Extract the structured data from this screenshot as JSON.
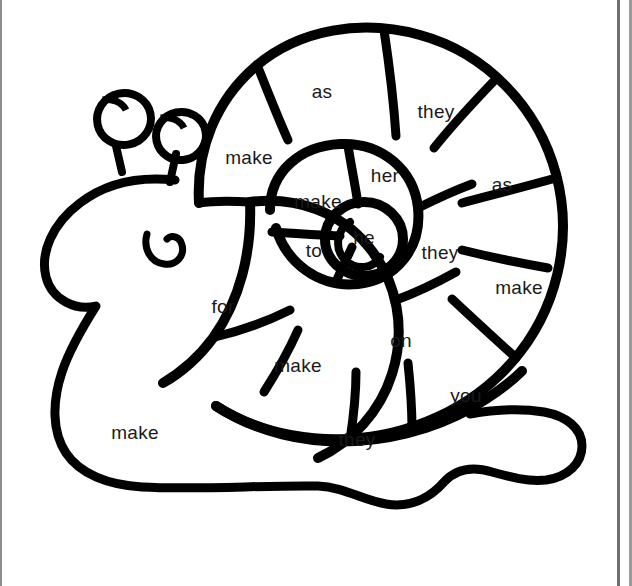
{
  "page": {
    "kind": "worksheet-coloring-page",
    "background_color": "#ffffff",
    "line_color": "#000000",
    "text_color": "#1a1a1a",
    "width": 632,
    "height": 586
  },
  "words": [
    {
      "id": "shell-outer-top-left",
      "text": "make",
      "x": 249,
      "y": 158,
      "size": 19
    },
    {
      "id": "shell-outer-top",
      "text": "as",
      "x": 322,
      "y": 92,
      "size": 19
    },
    {
      "id": "shell-outer-top-right",
      "text": "they",
      "x": 436,
      "y": 112,
      "size": 19
    },
    {
      "id": "shell-outer-right-upper",
      "text": "as",
      "x": 502,
      "y": 185,
      "size": 19
    },
    {
      "id": "shell-outer-right-lower",
      "text": "make",
      "x": 519,
      "y": 288,
      "size": 19
    },
    {
      "id": "shell-outer-bottom-right",
      "text": "you",
      "x": 466,
      "y": 396,
      "size": 19
    },
    {
      "id": "shell-outer-bottom",
      "text": "they",
      "x": 357,
      "y": 440,
      "size": 19
    },
    {
      "id": "shell-mid-bottom",
      "text": "make",
      "x": 298,
      "y": 366,
      "size": 19
    },
    {
      "id": "shell-mid-left",
      "text": "for",
      "x": 223,
      "y": 307,
      "size": 19
    },
    {
      "id": "shell-mid-bottom-right",
      "text": "on",
      "x": 401,
      "y": 341,
      "size": 19
    },
    {
      "id": "shell-mid-right",
      "text": "they",
      "x": 440,
      "y": 253,
      "size": 19
    },
    {
      "id": "shell-inner-top",
      "text": "her",
      "x": 385,
      "y": 176,
      "size": 19
    },
    {
      "id": "shell-inner-left",
      "text": "make",
      "x": 318,
      "y": 202,
      "size": 19
    },
    {
      "id": "shell-inner-bottom-left",
      "text": "to",
      "x": 314,
      "y": 251,
      "size": 19
    },
    {
      "id": "shell-center",
      "text": "he",
      "x": 364,
      "y": 238,
      "size": 19
    },
    {
      "id": "body-foot-left",
      "text": "make",
      "x": 135,
      "y": 433,
      "size": 19
    }
  ],
  "word_list_flat": [
    "make",
    "as",
    "they",
    "as",
    "make",
    "you",
    "they",
    "make",
    "for",
    "on",
    "they",
    "her",
    "make",
    "to",
    "he",
    "make"
  ],
  "unique_words": [
    "as",
    "for",
    "he",
    "her",
    "make",
    "on",
    "they",
    "to",
    "you"
  ]
}
